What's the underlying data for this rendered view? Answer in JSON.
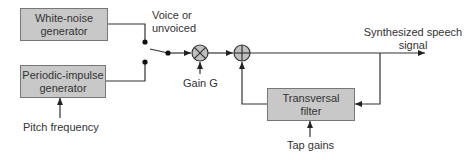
{
  "diagram": {
    "blocks": {
      "white_noise": {
        "line1": "White-noise",
        "line2": "generator"
      },
      "periodic_impulse": {
        "line1": "Periodic-impulse",
        "line2": "generator"
      },
      "transversal_filter": {
        "line1": "Transversal",
        "line2": "filter"
      }
    },
    "labels": {
      "voice_switch_line1": "Voice or",
      "voice_switch_line2": "unvoiced",
      "pitch_frequency": "Pitch frequency",
      "gain": "Gain G",
      "output_line1": "Synthesized speech",
      "output_line2": "signal",
      "tap_gains": "Tap gains"
    },
    "nodes": {
      "multiplier": "multiplier-x",
      "adder": "adder-plus"
    },
    "colors": {
      "block_fill": "#c8c8c8",
      "block_border": "#777777",
      "line": "#333333",
      "node_fill": "#c0c0c0"
    }
  }
}
